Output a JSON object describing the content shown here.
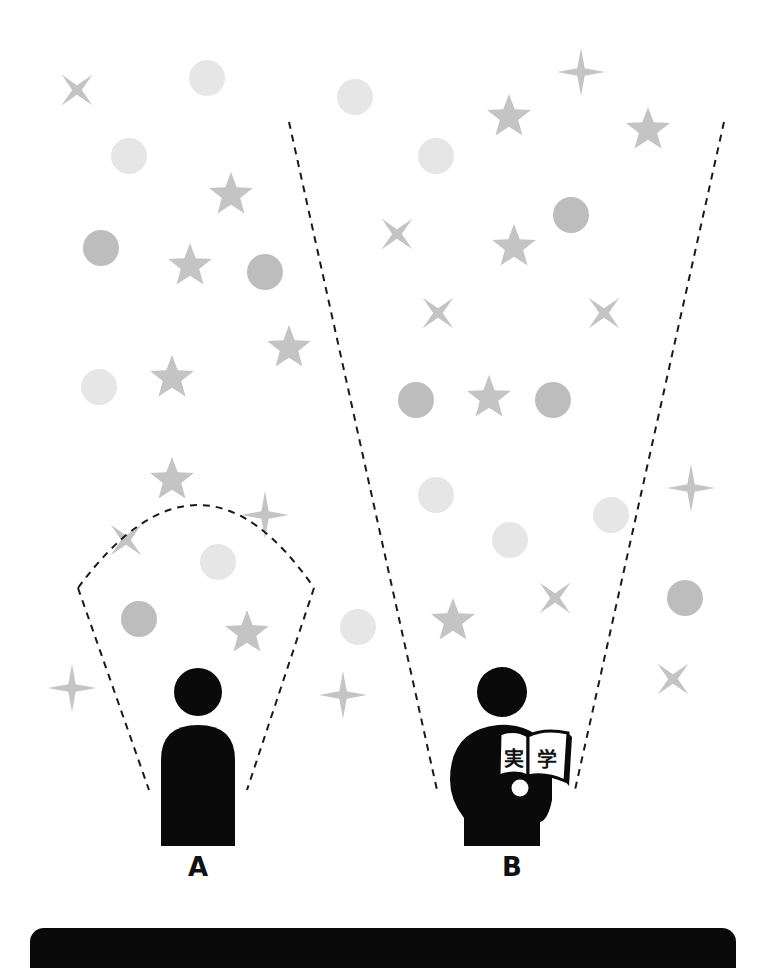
{
  "diagram": {
    "colors": {
      "background": "#ffffff",
      "light_circle": "#e6e6e6",
      "dark_circle": "#bdbdbd",
      "star": "#c4c4c4",
      "figure": "#0a0a0a",
      "dashed_line": "#1a1a1a"
    },
    "people": [
      {
        "id": "A",
        "label": "A",
        "holds_book": false,
        "cx": 198,
        "head_cy": 692,
        "view": "narrow"
      },
      {
        "id": "B",
        "label": "B",
        "holds_book": true,
        "book_text": [
          "実",
          "学"
        ],
        "cx": 502,
        "head_cy": 692,
        "view": "wide"
      }
    ],
    "shapes": [
      {
        "type": "x4",
        "x": 77,
        "y": 90,
        "r": 18,
        "tone": "star"
      },
      {
        "type": "circle",
        "x": 207,
        "y": 78,
        "r": 18,
        "tone": "light"
      },
      {
        "type": "circle",
        "x": 355,
        "y": 97,
        "r": 18,
        "tone": "light"
      },
      {
        "type": "circle",
        "x": 129,
        "y": 156,
        "r": 18,
        "tone": "light"
      },
      {
        "type": "star5",
        "x": 231,
        "y": 195,
        "r": 23,
        "tone": "star"
      },
      {
        "type": "circle",
        "x": 101,
        "y": 248,
        "r": 18,
        "tone": "dark"
      },
      {
        "type": "star5",
        "x": 190,
        "y": 266,
        "r": 23,
        "tone": "star"
      },
      {
        "type": "circle",
        "x": 265,
        "y": 272,
        "r": 18,
        "tone": "dark"
      },
      {
        "type": "sparkle",
        "x": 581,
        "y": 72,
        "r": 24,
        "tone": "star"
      },
      {
        "type": "star5",
        "x": 509,
        "y": 117,
        "r": 23,
        "tone": "star"
      },
      {
        "type": "star5",
        "x": 648,
        "y": 130,
        "r": 23,
        "tone": "star"
      },
      {
        "type": "circle",
        "x": 436,
        "y": 156,
        "r": 18,
        "tone": "light"
      },
      {
        "type": "circle",
        "x": 571,
        "y": 215,
        "r": 18,
        "tone": "dark"
      },
      {
        "type": "x4",
        "x": 397,
        "y": 234,
        "r": 18,
        "tone": "star"
      },
      {
        "type": "star5",
        "x": 514,
        "y": 247,
        "r": 23,
        "tone": "star"
      },
      {
        "type": "x4",
        "x": 438,
        "y": 313,
        "r": 18,
        "tone": "star"
      },
      {
        "type": "x4",
        "x": 604,
        "y": 313,
        "r": 18,
        "tone": "star"
      },
      {
        "type": "star5",
        "x": 289,
        "y": 348,
        "r": 23,
        "tone": "star"
      },
      {
        "type": "circle",
        "x": 99,
        "y": 387,
        "r": 18,
        "tone": "light"
      },
      {
        "type": "star5",
        "x": 172,
        "y": 378,
        "r": 23,
        "tone": "star"
      },
      {
        "type": "circle",
        "x": 416,
        "y": 400,
        "r": 18,
        "tone": "dark"
      },
      {
        "type": "star5",
        "x": 489,
        "y": 398,
        "r": 23,
        "tone": "star"
      },
      {
        "type": "circle",
        "x": 553,
        "y": 400,
        "r": 18,
        "tone": "dark"
      },
      {
        "type": "star5",
        "x": 172,
        "y": 480,
        "r": 23,
        "tone": "star"
      },
      {
        "type": "sparkle",
        "x": 265,
        "y": 515,
        "r": 24,
        "tone": "star"
      },
      {
        "type": "circle",
        "x": 436,
        "y": 495,
        "r": 18,
        "tone": "light"
      },
      {
        "type": "sparkle",
        "x": 691,
        "y": 488,
        "r": 24,
        "tone": "star"
      },
      {
        "type": "circle",
        "x": 611,
        "y": 515,
        "r": 18,
        "tone": "light"
      },
      {
        "type": "circle",
        "x": 510,
        "y": 540,
        "r": 18,
        "tone": "light"
      },
      {
        "type": "x4",
        "x": 126,
        "y": 540,
        "r": 18,
        "tone": "star"
      },
      {
        "type": "circle",
        "x": 218,
        "y": 562,
        "r": 18,
        "tone": "light"
      },
      {
        "type": "x4",
        "x": 555,
        "y": 598,
        "r": 18,
        "tone": "star"
      },
      {
        "type": "circle",
        "x": 685,
        "y": 598,
        "r": 18,
        "tone": "dark"
      },
      {
        "type": "circle",
        "x": 139,
        "y": 619,
        "r": 18,
        "tone": "dark"
      },
      {
        "type": "star5",
        "x": 453,
        "y": 621,
        "r": 23,
        "tone": "star"
      },
      {
        "type": "star5",
        "x": 247,
        "y": 633,
        "r": 23,
        "tone": "star"
      },
      {
        "type": "circle",
        "x": 358,
        "y": 627,
        "r": 18,
        "tone": "light"
      },
      {
        "type": "sparkle",
        "x": 72,
        "y": 688,
        "r": 24,
        "tone": "star"
      },
      {
        "type": "sparkle",
        "x": 343,
        "y": 695,
        "r": 24,
        "tone": "star"
      },
      {
        "type": "x4",
        "x": 673,
        "y": 679,
        "r": 18,
        "tone": "star"
      }
    ],
    "view_lines": {
      "A_left": [
        [
          78,
          588
        ],
        [
          149,
          790
        ]
      ],
      "A_right": [
        [
          314,
          588
        ],
        [
          247,
          790
        ]
      ],
      "A_arc": {
        "from": [
          78,
          588
        ],
        "via": [
          198,
          505
        ],
        "to": [
          314,
          588
        ]
      },
      "B_left": [
        [
          289,
          122
        ],
        [
          437,
          790
        ]
      ],
      "B_right": [
        [
          724,
          122
        ],
        [
          575,
          790
        ]
      ]
    }
  }
}
